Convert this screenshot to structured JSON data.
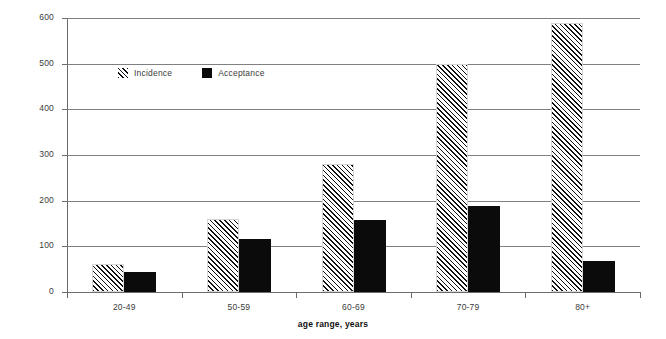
{
  "chart_data": {
    "type": "bar",
    "title": "",
    "subtitle": "",
    "xlabel": "age range, years",
    "ylabel": "per million population",
    "categories": [
      "20-49",
      "50-59",
      "60-69",
      "70-79",
      "80+"
    ],
    "series": [
      {
        "name": "Incidence",
        "values": [
          61,
          160,
          280,
          500,
          590
        ],
        "fill": "diagonal-hatch"
      },
      {
        "name": "Acceptance",
        "values": [
          44,
          117,
          157,
          188,
          69
        ],
        "fill": "solid-black"
      }
    ],
    "ylim": [
      0,
      600
    ],
    "ytick_labels": [
      "0",
      "100",
      "200",
      "300",
      "400",
      "500",
      "600"
    ],
    "ytick_values": [
      0,
      100,
      200,
      300,
      400,
      500,
      600
    ],
    "grid": true,
    "grid_axis": "y",
    "legend_position": "inside-upper-left",
    "colors": {
      "hatch": "#111111",
      "solid": "#0b0b0b",
      "gridline": "#808080",
      "axis": "#6b6b6b",
      "background": "#ffffff",
      "tick_text": "#3c3c3c",
      "axis_title_text": "#111111"
    }
  },
  "legend": {
    "entries": [
      {
        "label": "Incidence",
        "icon": "hatched-square-swatch"
      },
      {
        "label": "Acceptance",
        "icon": "solid-square-swatch"
      }
    ]
  }
}
